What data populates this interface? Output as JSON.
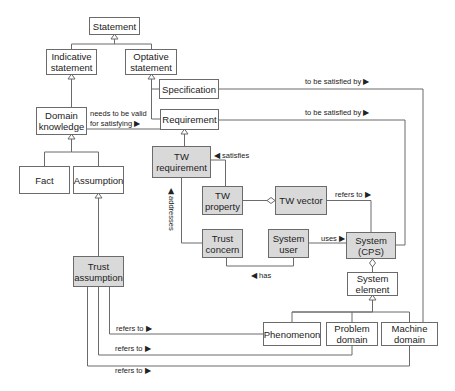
{
  "diagram": {
    "title": "",
    "classes": {
      "statement": "Statement",
      "indicative_statement": "Indicative\nstatement",
      "optative_statement": "Optative\nstatement",
      "specification": "Specification",
      "domain_knowledge": "Domain\nknowledge",
      "requirement": "Requirement",
      "fact": "Fact",
      "assumption": "Assumption",
      "tw_requirement": "TW\nrequirement",
      "tw_property": "TW\nproperty",
      "tw_vector": "TW vector",
      "trust_concern": "Trust\nconcern",
      "system_user": "System\nuser",
      "system_cps": "System\n(CPS)",
      "trust_assumption": "Trust\nassumption",
      "system_element": "System\nelement",
      "phenomenon": "Phenomenon",
      "problem_domain": "Problem\ndomain",
      "machine_domain": "Machine\ndomain"
    },
    "associations": {
      "spec_satisfied_by": "to be satisfied by ▶",
      "req_satisfied_by": "to be satisfied by ▶",
      "needs_valid_1": "needs to be valid",
      "needs_valid_2": "for satisfying ▶",
      "satisfies": "◀ satisfies",
      "refers_to_vector": "refers to ▶",
      "addresses": "◀ addresses",
      "uses": "uses ▶",
      "has": "◀ has",
      "refers_to_1": "refers to ▶",
      "refers_to_2": "refers to ▶",
      "refers_to_3": "refers to ▶"
    },
    "colors": {
      "line": "#6b6b6b",
      "highlight_fill": "#d9d9d9",
      "plain_fill": "#ffffff"
    }
  }
}
